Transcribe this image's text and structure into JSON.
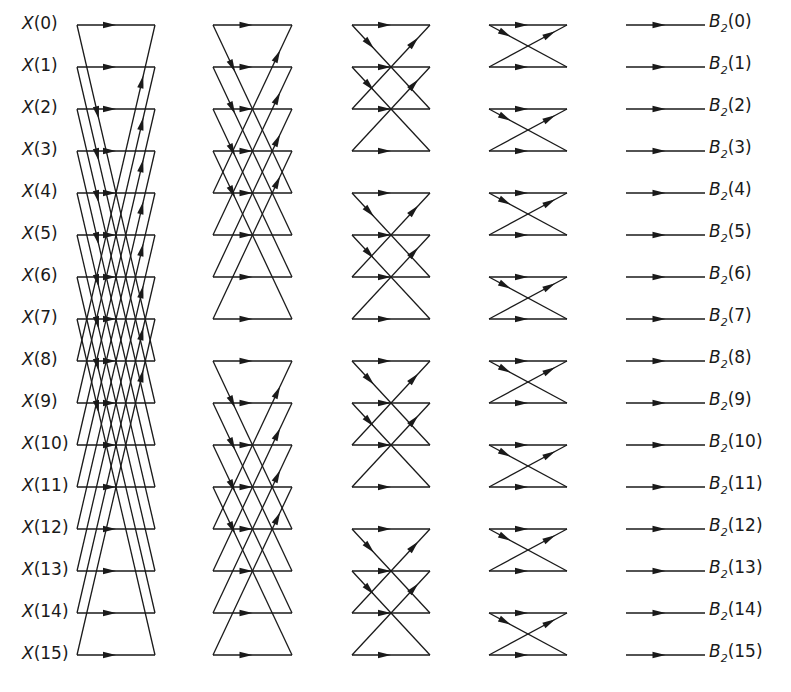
{
  "diagram": {
    "n_points": 16,
    "input_prefix": "X",
    "output_prefix": "B",
    "output_subscript": "2",
    "inputs": [
      "X(0)",
      "X(1)",
      "X(2)",
      "X(3)",
      "X(4)",
      "X(5)",
      "X(6)",
      "X(7)",
      "X(8)",
      "X(9)",
      "X(10)",
      "X(11)",
      "X(12)",
      "X(13)",
      "X(14)",
      "X(15)"
    ],
    "outputs": [
      "0",
      "1",
      "2",
      "3",
      "4",
      "5",
      "6",
      "7",
      "8",
      "9",
      "10",
      "11",
      "12",
      "13",
      "14",
      "15"
    ],
    "stages": [
      {
        "name": "stage-1",
        "x_start": 77,
        "x_end": 155,
        "span": 8,
        "group": 16
      },
      {
        "name": "stage-2",
        "x_start": 213,
        "x_end": 292,
        "span": 4,
        "group": 8
      },
      {
        "name": "stage-3",
        "x_start": 352,
        "x_end": 430,
        "span": 2,
        "group": 4
      },
      {
        "name": "stage-4",
        "x_start": 489,
        "x_end": 567,
        "span": 1,
        "group": 2
      },
      {
        "name": "stage-5",
        "x_start": 626,
        "x_end": 705,
        "span": 0,
        "group": 1
      }
    ],
    "row_y_start": 25,
    "row_spacing": 42,
    "line_color": "#1a1a1a"
  }
}
